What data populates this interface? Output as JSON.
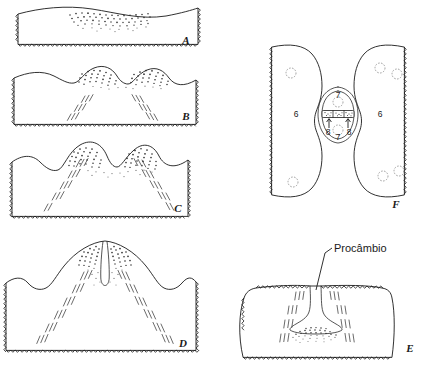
{
  "figure": {
    "kind": "line-drawing-diagram",
    "background_color": "#ffffff",
    "ink_color": "#1a1a1a",
    "width_px": 432,
    "height_px": 365
  },
  "panels": [
    {
      "id": "A",
      "letter": "A",
      "region": "top-left",
      "description": "Flat shoot apex with stippled (densely dotted) superficial zone near the apical surface; lower and lateral edges drawn as torn/cut zigzag margins."
    },
    {
      "id": "B",
      "letter": "B",
      "region": "left, second from top",
      "description": "Two low rounded bulges (incipient leaf primordia) with stippling over each bulge; two oblique groups of short parallel lines below indicate early procambial strands."
    },
    {
      "id": "C",
      "letter": "C",
      "region": "left, third from top",
      "description": "Two taller primordia separated by a deep notch; stippling on both flanks and oblique rows of short parallel dashes forming V-shaped procambial traces."
    },
    {
      "id": "D",
      "letter": "D",
      "region": "bottom-left",
      "description": "Dome-shaped apex with a narrow median cleft; heavy stippling flanking the cleft and long divergent procambial strand rows descending to the cut base."
    },
    {
      "id": "E",
      "letter": "E",
      "region": "bottom-right",
      "description": "Near-flat apex with a narrow median invagination; stippled cone beneath it labelled Procambio, flanked by oblique procambial strand rows."
    },
    {
      "id": "F",
      "letter": "F",
      "region": "right, upper",
      "description": "Surface (paradermal) view of a dividing cell between two flanking cells; daughter nuclei above and below a stippled cell plate, with arrows marking the phragmoplast, labelled 6, 7 and 8."
    }
  ],
  "labels": {
    "panel_letters": [
      "A",
      "B",
      "C",
      "D",
      "E",
      "F"
    ],
    "callouts": [
      {
        "text": "Procâmbio",
        "panel": "E",
        "points_to": "median procambial strand below the apical notch"
      }
    ],
    "numbered": [
      {
        "text": "6",
        "panel": "F",
        "position": "left flanking cell",
        "meaning": "flanking cell"
      },
      {
        "text": "6",
        "panel": "F",
        "position": "right flanking cell",
        "meaning": "flanking cell"
      },
      {
        "text": "7",
        "panel": "F",
        "position": "upper daughter cell",
        "meaning": "daughter cell"
      },
      {
        "text": "7",
        "panel": "F",
        "position": "lower daughter cell",
        "meaning": "daughter cell"
      },
      {
        "text": "8",
        "panel": "F",
        "position": "left arrow at cell plate",
        "meaning": "phragmoplast / new cell wall"
      },
      {
        "text": "8",
        "panel": "F",
        "position": "right arrow at cell plate",
        "meaning": "phragmoplast / new cell wall"
      }
    ]
  },
  "legend_keys": {
    "stipple": "dense dotted shading = meristematic / densely cytoplasmic tissue",
    "short_parallel_dashes": "groups of three short oblique lines = elongating procambial cells",
    "zigzag_margin": "torn or cut edge of the section",
    "dashed_circle": "cell nucleus"
  }
}
